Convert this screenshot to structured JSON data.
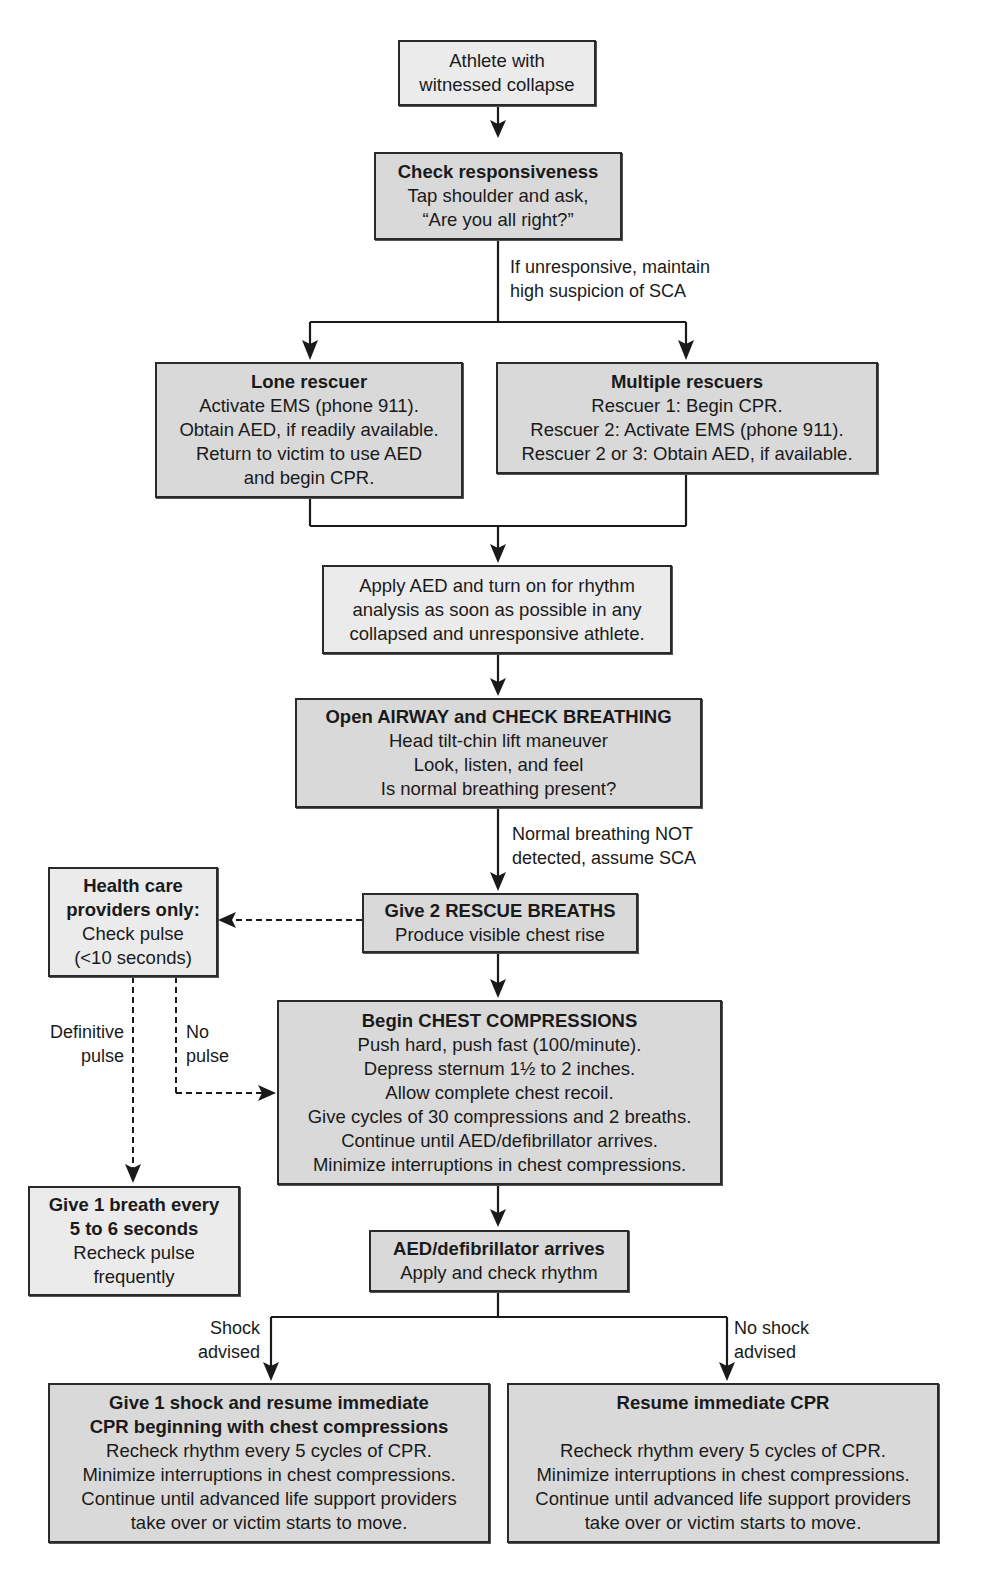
{
  "diagram": {
    "type": "flowchart",
    "nodes": {
      "start": {
        "lines": [
          "Athlete with",
          "witnessed collapse"
        ]
      },
      "check": {
        "title": "Check responsiveness",
        "lines": [
          "Tap shoulder and ask,",
          "“Are you all right?”"
        ]
      },
      "lone": {
        "title": "Lone rescuer",
        "lines": [
          "Activate EMS (phone 911).",
          "Obtain AED, if readily available.",
          "Return to victim to use AED",
          "and begin CPR."
        ]
      },
      "multiple": {
        "title": "Multiple rescuers",
        "lines": [
          "Rescuer 1: Begin CPR.",
          "Rescuer 2: Activate EMS (phone 911).",
          "Rescuer 2 or 3: Obtain AED, if available."
        ]
      },
      "apply_aed": {
        "lines": [
          "Apply AED and turn on for rhythm",
          "analysis as soon as possible in any",
          "collapsed and unresponsive athlete."
        ]
      },
      "airway": {
        "title": "Open AIRWAY and CHECK BREATHING",
        "lines": [
          "Head tilt-chin lift maneuver",
          "Look, listen, and feel",
          "Is normal breathing present?"
        ]
      },
      "rescue_breaths": {
        "title": "Give 2 RESCUE BREATHS",
        "lines": [
          "Produce visible chest rise"
        ]
      },
      "hcp": {
        "title_lines": [
          "Health care",
          "providers only:"
        ],
        "lines": [
          "Check pulse",
          "(<10 seconds)"
        ]
      },
      "compressions": {
        "title": "Begin CHEST COMPRESSIONS",
        "lines": [
          "Push hard, push fast (100/minute).",
          "Depress sternum 1½ to 2 inches.",
          "Allow complete chest recoil.",
          "Give cycles of 30 compressions and 2 breaths.",
          "Continue until AED/defibrillator arrives.",
          "Minimize interruptions in chest compressions."
        ]
      },
      "one_breath": {
        "title_lines": [
          "Give 1 breath every",
          "5 to 6 seconds"
        ],
        "lines": [
          "Recheck pulse",
          "frequently"
        ]
      },
      "aed_arrives": {
        "title": "AED/defibrillator arrives",
        "lines": [
          "Apply and check rhythm"
        ]
      },
      "shock": {
        "title_lines": [
          "Give 1 shock and resume immediate",
          "CPR beginning with chest compressions"
        ],
        "lines": [
          "Recheck rhythm every 5 cycles of CPR.",
          "Minimize interruptions in chest compressions.",
          "Continue until advanced life support providers",
          "take over or victim starts to move."
        ]
      },
      "no_shock": {
        "title": "Resume immediate CPR",
        "lines": [
          "Recheck rhythm every 5 cycles of CPR.",
          "Minimize interruptions in chest compressions.",
          "Continue until advanced life support providers",
          "take over or victim starts to move."
        ]
      }
    },
    "edge_labels": {
      "unresponsive": [
        "If unresponsive, maintain",
        "high suspicion of SCA"
      ],
      "not_breathing": [
        "Normal breathing NOT",
        "detected, assume SCA"
      ],
      "definitive_pulse": [
        "Definitive",
        "pulse"
      ],
      "no_pulse": [
        "No",
        "pulse"
      ],
      "shock_advised": [
        "Shock",
        "advised"
      ],
      "no_shock_advised": [
        "No shock",
        "advised"
      ]
    },
    "colors": {
      "box_fill": "#d9d9d9",
      "box_fill_light": "#ebebeb",
      "line": "#1a1a1a"
    }
  }
}
